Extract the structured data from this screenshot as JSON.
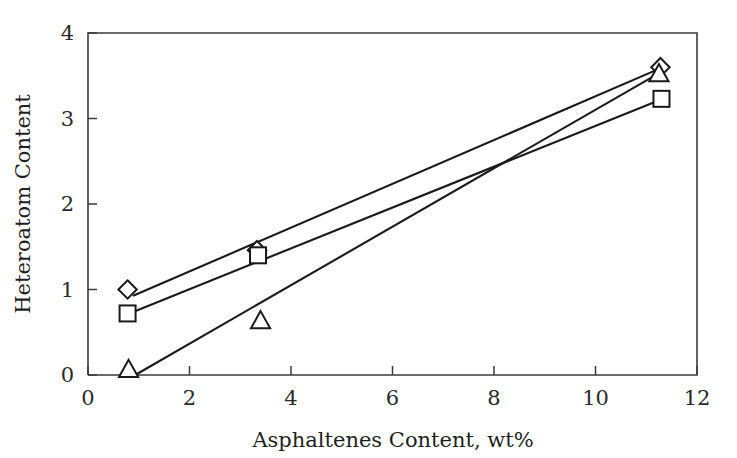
{
  "chart_data": {
    "type": "scatter",
    "title": "",
    "xlabel": "Asphaltenes Content, wt%",
    "ylabel": "Heteroatom Content",
    "xlim": [
      0,
      12
    ],
    "ylim": [
      0,
      4
    ],
    "xticks": [
      "0",
      "2",
      "4",
      "6",
      "8",
      "10",
      "12"
    ],
    "yticks": [
      "0",
      "1",
      "2",
      "3",
      "4"
    ],
    "xtick_values": [
      0,
      2,
      4,
      6,
      8,
      10,
      12
    ],
    "ytick_values": [
      0,
      1,
      2,
      3,
      4
    ],
    "grid": false,
    "legend": "none",
    "frame": "box",
    "series": [
      {
        "name": "series-diamond",
        "marker": "diamond",
        "x": [
          0.78,
          3.33,
          11.28
        ],
        "y": [
          1.0,
          1.46,
          3.6
        ],
        "trendline": {
          "x": [
            0.9,
            11.25
          ],
          "y": [
            0.93,
            3.58
          ]
        }
      },
      {
        "name": "series-square",
        "marker": "square",
        "x": [
          0.78,
          3.35,
          11.3
        ],
        "y": [
          0.72,
          1.4,
          3.23
        ],
        "trendline": {
          "x": [
            0.9,
            11.28
          ],
          "y": [
            0.74,
            3.22
          ]
        }
      },
      {
        "name": "series-triangle",
        "marker": "triangle",
        "x": [
          0.8,
          3.4,
          11.25
        ],
        "y": [
          0.06,
          0.63,
          3.52
        ],
        "trendline": {
          "x": [
            0.93,
            11.22
          ],
          "y": [
            0.0,
            3.52
          ]
        }
      }
    ]
  },
  "axes": {
    "x_title": "Asphaltenes Content, wt%",
    "y_title": "Heteroatom Content"
  }
}
